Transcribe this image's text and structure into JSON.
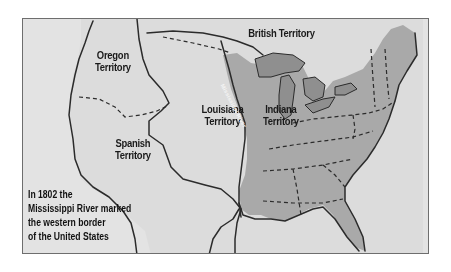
{
  "map": {
    "title": "United States in 1802",
    "colors": {
      "background": "#e3e3e3",
      "us_territory": "#a9a9a9",
      "great_lakes": "#8f8f8f",
      "border": "#2b2b2b",
      "frame": "#6e6e6e"
    },
    "regions": [
      {
        "id": "british",
        "label": [
          "British Territory"
        ]
      },
      {
        "id": "oregon",
        "label": [
          "Oregon",
          "Territory"
        ]
      },
      {
        "id": "louisiana",
        "label": [
          "Louisiana",
          "Territory"
        ]
      },
      {
        "id": "indiana",
        "label": [
          "Indiana",
          "Territory"
        ]
      },
      {
        "id": "spanish",
        "label": [
          "Spanish",
          "Territory"
        ]
      }
    ],
    "river_label": "Mississippi River",
    "caption": [
      "In 1802 the",
      "Mississippi River marked",
      "the western border",
      "of the United States"
    ]
  }
}
